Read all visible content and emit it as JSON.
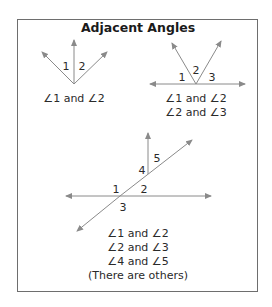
{
  "title": "Adjacent Angles",
  "colors": {
    "ray": "#8a8a8a",
    "text": "#222222",
    "frame": "#6e6e6e"
  },
  "figures": [
    {
      "id": "fig1",
      "labels": [
        "1",
        "2"
      ],
      "captions": [
        "∠1 and ∠2"
      ]
    },
    {
      "id": "fig2",
      "labels": [
        "1",
        "2",
        "3"
      ],
      "captions": [
        "∠1 and ∠2",
        "∠2 and ∠3"
      ]
    },
    {
      "id": "fig3",
      "labels": [
        "1",
        "2",
        "3",
        "4",
        "5"
      ],
      "captions": [
        "∠1 and ∠2",
        "∠2 and ∠3",
        "∠4 and ∠5",
        "(There are others)"
      ]
    }
  ]
}
